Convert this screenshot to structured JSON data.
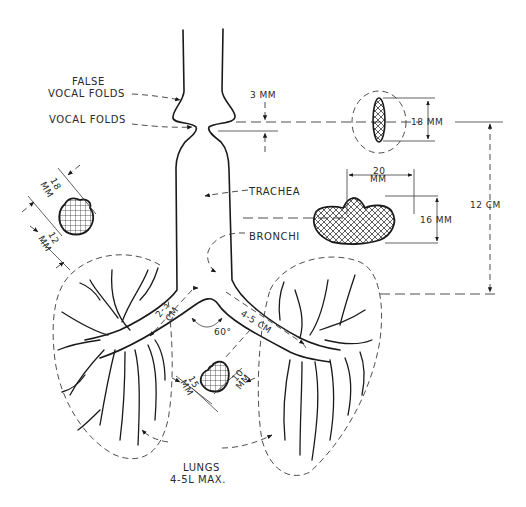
{
  "diagram": {
    "labels": {
      "false_vocal_folds_line1": "FALSE",
      "false_vocal_folds_line2": "VOCAL FOLDS",
      "vocal_folds": "VOCAL FOLDS",
      "trachea": "TRACHEA",
      "bronchi": "BRONCHI",
      "lungs_line1": "LUNGS",
      "lungs_line2": "4-5L MAX."
    },
    "dimensions": {
      "glottis_gap": "3 MM",
      "glottis_opening_height": "18 MM",
      "trachea_width_top": "20",
      "trachea_width_unit": "MM",
      "trachea_height": "16 MM",
      "trachea_length": "12 CM",
      "left_bronchus_length_top": "2-3",
      "left_bronchus_length_unit": "CM",
      "right_bronchus_length": "4-5 CM",
      "bifurcation_angle": "60°",
      "left_object_a_value": "18",
      "left_object_a_unit": "MM",
      "left_object_b_value": "12",
      "left_object_b_unit": "MM",
      "center_object_a_value": "15",
      "center_object_a_unit": "MM",
      "center_object_b_value": "10",
      "center_object_b_unit": "MM"
    },
    "colors": {
      "ink": "#1a1a1a",
      "background": "#ffffff"
    }
  }
}
